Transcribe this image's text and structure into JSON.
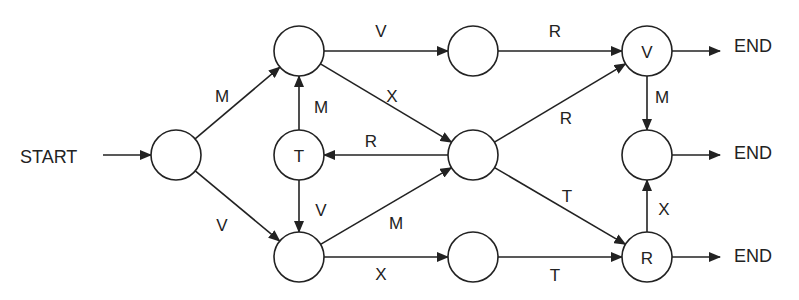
{
  "diagram": {
    "type": "state-transition",
    "terminals": {
      "start": {
        "label": "START",
        "x": 20,
        "y": 157
      },
      "ends": [
        {
          "label": "END",
          "x": 734,
          "y": 46
        },
        {
          "label": "END",
          "x": 734,
          "y": 153
        },
        {
          "label": "END",
          "x": 734,
          "y": 256
        }
      ]
    },
    "nodes": [
      {
        "id": "n0",
        "x": 176,
        "y": 155,
        "label": ""
      },
      {
        "id": "n1",
        "x": 299,
        "y": 51,
        "label": ""
      },
      {
        "id": "nT",
        "x": 299,
        "y": 155,
        "label": "T"
      },
      {
        "id": "n2",
        "x": 299,
        "y": 257,
        "label": ""
      },
      {
        "id": "n3",
        "x": 473,
        "y": 51,
        "label": ""
      },
      {
        "id": "n4",
        "x": 473,
        "y": 155,
        "label": ""
      },
      {
        "id": "n5",
        "x": 473,
        "y": 257,
        "label": ""
      },
      {
        "id": "nV",
        "x": 647,
        "y": 51,
        "label": "V"
      },
      {
        "id": "n6",
        "x": 647,
        "y": 155,
        "label": ""
      },
      {
        "id": "nR",
        "x": 647,
        "y": 257,
        "label": "R"
      }
    ],
    "edges": [
      {
        "from": "START",
        "to": "n0",
        "label": ""
      },
      {
        "from": "n0",
        "to": "n1",
        "label": "M",
        "lx": 222,
        "ly": 96
      },
      {
        "from": "n0",
        "to": "n2",
        "label": "V",
        "lx": 222,
        "ly": 225
      },
      {
        "from": "n1",
        "to": "n3",
        "label": "V",
        "lx": 381,
        "ly": 31
      },
      {
        "from": "n1",
        "to": "n4",
        "label": "X",
        "lx": 392,
        "ly": 96
      },
      {
        "from": "nT",
        "to": "n1",
        "label": "M",
        "lx": 321,
        "ly": 107
      },
      {
        "from": "n4",
        "to": "nT",
        "label": "R",
        "lx": 371,
        "ly": 141
      },
      {
        "from": "nT",
        "to": "n2",
        "label": "V",
        "lx": 321,
        "ly": 210
      },
      {
        "from": "n2",
        "to": "n4",
        "label": "M",
        "lx": 396,
        "ly": 223
      },
      {
        "from": "n2",
        "to": "n5",
        "label": "X",
        "lx": 381,
        "ly": 274
      },
      {
        "from": "n3",
        "to": "nV",
        "label": "R",
        "lx": 555,
        "ly": 31
      },
      {
        "from": "n4",
        "to": "nV",
        "label": "R",
        "lx": 566,
        "ly": 118
      },
      {
        "from": "n4",
        "to": "nR",
        "label": "T",
        "lx": 567,
        "ly": 196
      },
      {
        "from": "n5",
        "to": "nR",
        "label": "T",
        "lx": 555,
        "ly": 275
      },
      {
        "from": "nV",
        "to": "n6",
        "label": "M",
        "lx": 662,
        "ly": 97
      },
      {
        "from": "nR",
        "to": "n6",
        "label": "X",
        "lx": 664,
        "ly": 209
      },
      {
        "from": "nV",
        "to": "END",
        "label": ""
      },
      {
        "from": "n6",
        "to": "END",
        "label": ""
      },
      {
        "from": "nR",
        "to": "END",
        "label": ""
      }
    ]
  }
}
